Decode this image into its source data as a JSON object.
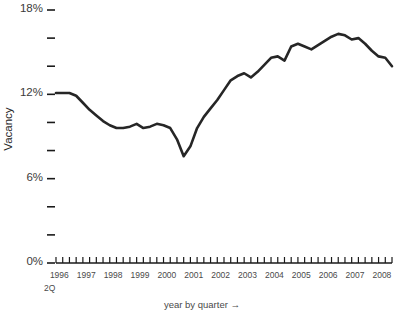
{
  "chart_data": {
    "type": "line",
    "title": "",
    "xlabel": "year by quarter →",
    "ylabel": "Vacancy",
    "x_start_label": "1996",
    "x_start_sublabel": "2Q",
    "ylim": [
      0,
      18
    ],
    "xlim": [
      1996.25,
      2008.75
    ],
    "grid": false,
    "legend": null,
    "y_tick_values": [
      18,
      16,
      14,
      12,
      10,
      8,
      6,
      4,
      2,
      0
    ],
    "y_tick_labels": [
      "18%",
      "",
      "",
      "12%",
      "",
      "",
      "6%",
      "",
      "",
      "0%"
    ],
    "x_tick_labels": [
      "1996",
      "1997",
      "1998",
      "1999",
      "2000",
      "2001",
      "2002",
      "2003",
      "2004",
      "2005",
      "2006",
      "2007",
      "2008"
    ],
    "x_tick_years": [
      1996,
      1997,
      1998,
      1999,
      2000,
      2001,
      2002,
      2003,
      2004,
      2005,
      2006,
      2007,
      2008
    ],
    "minor_tick_interval_quarters": 1,
    "line_color": "#262626",
    "axis_color": "#1a1a1a",
    "line_width": 2.6,
    "series": [
      {
        "name": "Vacancy",
        "x": [
          1996.25,
          1996.5,
          1996.75,
          1997.0,
          1997.25,
          1997.5,
          1997.75,
          1998.0,
          1998.25,
          1998.5,
          1998.75,
          1999.0,
          1999.25,
          1999.5,
          1999.75,
          2000.0,
          2000.25,
          2000.5,
          2000.75,
          2001.0,
          2001.25,
          2001.5,
          2001.75,
          2002.0,
          2002.25,
          2002.5,
          2002.75,
          2003.0,
          2003.25,
          2003.5,
          2003.75,
          2004.0,
          2004.25,
          2004.5,
          2004.75,
          2005.0,
          2005.25,
          2005.5,
          2005.75,
          2006.0,
          2006.25,
          2006.5,
          2006.75,
          2007.0,
          2007.25,
          2007.5,
          2007.75,
          2008.0,
          2008.25,
          2008.5,
          2008.75
        ],
        "x_quarter_labels": [
          "1996 2Q",
          "1996 3Q",
          "1996 4Q",
          "1997 1Q",
          "1997 2Q",
          "1997 3Q",
          "1997 4Q",
          "1998 1Q",
          "1998 2Q",
          "1998 3Q",
          "1998 4Q",
          "1999 1Q",
          "1999 2Q",
          "1999 3Q",
          "1999 4Q",
          "2000 1Q",
          "2000 2Q",
          "2000 3Q",
          "2000 4Q",
          "2001 1Q",
          "2001 2Q",
          "2001 3Q",
          "2001 4Q",
          "2002 1Q",
          "2002 2Q",
          "2002 3Q",
          "2002 4Q",
          "2003 1Q",
          "2003 2Q",
          "2003 3Q",
          "2003 4Q",
          "2004 1Q",
          "2004 2Q",
          "2004 3Q",
          "2004 4Q",
          "2005 1Q",
          "2005 2Q",
          "2005 3Q",
          "2005 4Q",
          "2006 1Q",
          "2006 2Q",
          "2006 3Q",
          "2006 4Q",
          "2007 1Q",
          "2007 2Q",
          "2007 3Q",
          "2007 4Q",
          "2008 1Q",
          "2008 2Q",
          "2008 3Q",
          "2008 4Q"
        ],
        "values": [
          12.1,
          12.1,
          12.1,
          11.9,
          11.4,
          10.9,
          10.5,
          10.1,
          9.8,
          9.6,
          9.6,
          9.7,
          9.9,
          9.6,
          9.7,
          9.9,
          9.8,
          9.6,
          8.8,
          7.6,
          8.3,
          9.6,
          10.4,
          11.0,
          11.6,
          12.3,
          13.0,
          13.3,
          13.5,
          13.2,
          13.6,
          14.1,
          14.6,
          14.7,
          14.4,
          15.4,
          15.6,
          15.4,
          15.2,
          15.5,
          15.8,
          16.1,
          16.3,
          16.2,
          15.9,
          16.0,
          15.6,
          15.1,
          14.7,
          14.6,
          14.0
        ]
      },
      {
        "name": "Vacancy (continued)",
        "x": [
          2006.0,
          2006.25,
          2006.5,
          2006.75,
          2007.0,
          2007.25,
          2007.5,
          2007.75,
          2008.0,
          2008.25,
          2008.5,
          2008.75
        ],
        "values": [
          15.5,
          15.8,
          16.1,
          16.3,
          16.2,
          15.9,
          16.0,
          15.6,
          15.1,
          14.7,
          14.6,
          14.0
        ]
      }
    ],
    "series_full": {
      "name": "Vacancy",
      "x_quarters": [
        "1996 2Q",
        "1996 3Q",
        "1996 4Q",
        "1997 1Q",
        "1997 2Q",
        "1997 3Q",
        "1997 4Q",
        "1998 1Q",
        "1998 2Q",
        "1998 3Q",
        "1998 4Q",
        "1999 1Q",
        "1999 2Q",
        "1999 3Q",
        "1999 4Q",
        "2000 1Q",
        "2000 2Q",
        "2000 3Q",
        "2000 4Q",
        "2001 1Q",
        "2001 2Q",
        "2001 3Q",
        "2001 4Q",
        "2002 1Q",
        "2002 2Q",
        "2002 3Q",
        "2002 4Q",
        "2003 1Q",
        "2003 2Q",
        "2003 3Q",
        "2003 4Q",
        "2004 1Q",
        "2004 2Q",
        "2004 3Q",
        "2004 4Q",
        "2005 1Q",
        "2005 2Q",
        "2005 3Q",
        "2005 4Q",
        "2006 1Q",
        "2006 2Q",
        "2006 3Q",
        "2006 4Q",
        "2007 1Q",
        "2007 2Q",
        "2007 3Q",
        "2007 4Q",
        "2008 1Q",
        "2008 2Q",
        "2008 3Q",
        "2008 4Q"
      ],
      "values": [
        12.1,
        12.1,
        12.1,
        11.9,
        11.4,
        10.9,
        10.5,
        10.1,
        9.8,
        9.6,
        9.6,
        9.7,
        9.9,
        9.6,
        9.7,
        9.9,
        9.8,
        9.6,
        8.8,
        7.6,
        8.3,
        9.6,
        10.4,
        11.0,
        11.6,
        12.3,
        13.0,
        13.3,
        13.5,
        13.2,
        13.6,
        14.1,
        14.6,
        14.7,
        14.4,
        15.4,
        15.6,
        15.4,
        15.2,
        15.5,
        15.8,
        16.1,
        16.3,
        16.2,
        15.9,
        16.0,
        15.6,
        15.1,
        14.7,
        14.6,
        14.0
      ]
    },
    "annotations": []
  }
}
